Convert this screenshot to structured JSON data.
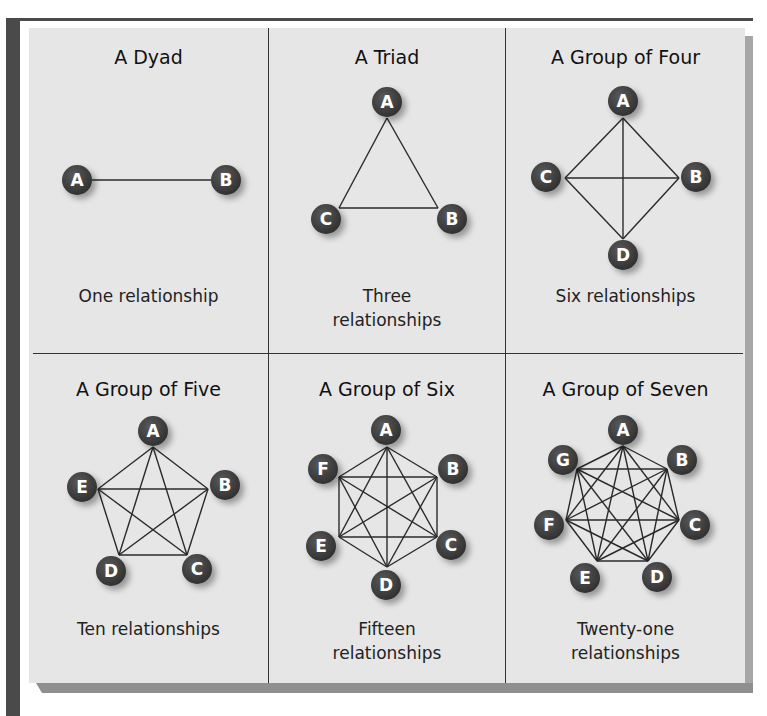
{
  "figure": {
    "node_color": "#3d3d3d",
    "label_color": "#ffffff",
    "edge_color": "#2a2a2a",
    "background_color": "#e6e6e6",
    "panels": [
      {
        "title": "A Dyad",
        "caption": "One relationship",
        "nodes": [
          {
            "label": "A",
            "cx": 77,
            "cy": 180,
            "vx": 92,
            "vy": 180
          },
          {
            "label": "B",
            "cx": 226,
            "cy": 180,
            "vx": 211,
            "vy": 180
          }
        ]
      },
      {
        "title": "A Triad",
        "caption": "Three relationships",
        "nodes": [
          {
            "label": "A",
            "cx": 387,
            "cy": 102,
            "vx": 387,
            "vy": 118
          },
          {
            "label": "B",
            "cx": 452,
            "cy": 219,
            "vx": 438,
            "vy": 208
          },
          {
            "label": "C",
            "cx": 326,
            "cy": 219,
            "vx": 339,
            "vy": 208
          }
        ]
      },
      {
        "title": "A Group of Four",
        "caption": "Six relationships",
        "nodes": [
          {
            "label": "A",
            "cx": 623,
            "cy": 101,
            "vx": 623,
            "vy": 118
          },
          {
            "label": "B",
            "cx": 696,
            "cy": 177,
            "vx": 679,
            "vy": 178
          },
          {
            "label": "C",
            "cx": 546,
            "cy": 177,
            "vx": 565,
            "vy": 178
          },
          {
            "label": "D",
            "cx": 623,
            "cy": 255,
            "vx": 623,
            "vy": 239
          }
        ]
      },
      {
        "title": "A Group of Five",
        "caption": "Ten relationships",
        "nodes": [
          {
            "label": "A",
            "cx": 153,
            "cy": 431,
            "vx": 153,
            "vy": 447
          },
          {
            "label": "B",
            "cx": 225,
            "cy": 485,
            "vx": 208,
            "vy": 489
          },
          {
            "label": "C",
            "cx": 197,
            "cy": 569,
            "vx": 187,
            "vy": 555
          },
          {
            "label": "D",
            "cx": 111,
            "cy": 571,
            "vx": 119,
            "vy": 555
          },
          {
            "label": "E",
            "cx": 82,
            "cy": 487,
            "vx": 98,
            "vy": 489
          }
        ]
      },
      {
        "title": "A Group of Six",
        "caption": "Fifteen relationships",
        "nodes": [
          {
            "label": "A",
            "cx": 386,
            "cy": 430,
            "vx": 387,
            "vy": 447
          },
          {
            "label": "B",
            "cx": 453,
            "cy": 469,
            "vx": 437,
            "vy": 477
          },
          {
            "label": "C",
            "cx": 451,
            "cy": 545,
            "vx": 437,
            "vy": 537
          },
          {
            "label": "D",
            "cx": 386,
            "cy": 585,
            "vx": 387,
            "vy": 567
          },
          {
            "label": "E",
            "cx": 321,
            "cy": 546,
            "vx": 339,
            "vy": 537
          },
          {
            "label": "F",
            "cx": 323,
            "cy": 469,
            "vx": 339,
            "vy": 477
          }
        ]
      },
      {
        "title": "A Group of Seven",
        "caption": "Twenty-one relationships",
        "nodes": [
          {
            "label": "A",
            "cx": 623,
            "cy": 430,
            "vx": 623,
            "vy": 446
          },
          {
            "label": "B",
            "cx": 682,
            "cy": 460,
            "vx": 667,
            "vy": 469
          },
          {
            "label": "C",
            "cx": 695,
            "cy": 525,
            "vx": 679,
            "vy": 520
          },
          {
            "label": "D",
            "cx": 657,
            "cy": 577,
            "vx": 648,
            "vy": 561
          },
          {
            "label": "E",
            "cx": 585,
            "cy": 578,
            "vx": 597,
            "vy": 561
          },
          {
            "label": "F",
            "cx": 549,
            "cy": 525,
            "vx": 566,
            "vy": 520
          },
          {
            "label": "G",
            "cx": 563,
            "cy": 460,
            "vx": 577,
            "vy": 469
          }
        ]
      }
    ]
  },
  "text": {
    "dyad_title": "A Dyad",
    "dyad_caption": "One relationship",
    "triad_title": "A Triad",
    "triad_caption_1": "Three",
    "triad_caption_2": "relationships",
    "four_title": "A Group of Four",
    "four_caption": "Six relationships",
    "five_title": "A Group of Five",
    "five_caption": "Ten relationships",
    "six_title": "A Group of Six",
    "six_caption_1": "Fifteen",
    "six_caption_2": "relationships",
    "seven_title": "A Group of Seven",
    "seven_caption_1": "Twenty-one",
    "seven_caption_2": "relationships"
  }
}
